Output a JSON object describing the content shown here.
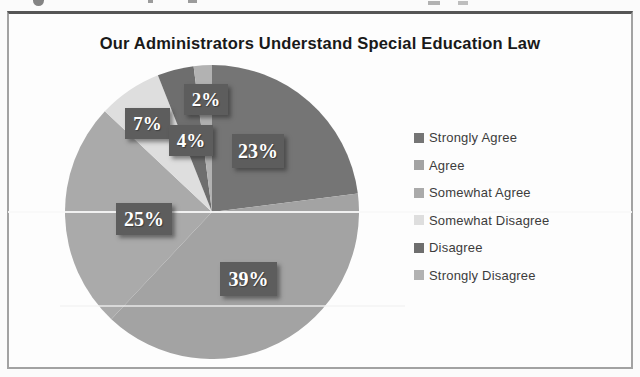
{
  "chart_data": {
    "type": "pie",
    "title": "Our Administrators Understand Special Education Law",
    "direction": "clockwise",
    "start_angle_deg": 0,
    "total": 100,
    "series": [
      {
        "label": "Strongly Agree",
        "value": 23,
        "data_label": "23%",
        "color": "#757575"
      },
      {
        "label": "Agree",
        "value": 39,
        "data_label": "39%",
        "color": "#a3a3a3"
      },
      {
        "label": "Somewhat Agree",
        "value": 25,
        "data_label": "25%",
        "color": "#aaaaaa"
      },
      {
        "label": "Somewhat Disagree",
        "value": 7,
        "data_label": "7%",
        "color": "#dedede"
      },
      {
        "label": "Disagree",
        "value": 4,
        "data_label": "4%",
        "color": "#6e6e6e"
      },
      {
        "label": "Strongly Disagree",
        "value": 2,
        "data_label": "2%",
        "color": "#b2b2b2"
      }
    ],
    "legend_position": "right",
    "label_style": {
      "box_color": "#5d5d5d",
      "text_color": "#ffffff"
    }
  }
}
